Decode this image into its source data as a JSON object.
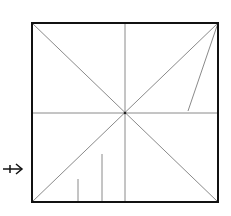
{
  "diagram": {
    "type": "origami-crease-pattern",
    "canvas": {
      "width": 231,
      "height": 216
    },
    "colors": {
      "background": "#ffffff",
      "border": "#111111",
      "crease": "#8a8a8a",
      "arrow": "#111111",
      "center_dot": "#222222"
    },
    "square": {
      "x1": 32,
      "y1": 23,
      "x2": 218,
      "y2": 202
    },
    "center": {
      "x": 125,
      "y": 113
    },
    "creases": [
      {
        "id": "diagonal-tl-br",
        "x1": 32,
        "y1": 23,
        "x2": 218,
        "y2": 202
      },
      {
        "id": "diagonal-tr-bl",
        "x1": 218,
        "y1": 23,
        "x2": 32,
        "y2": 202
      },
      {
        "id": "vertical-center",
        "x1": 125,
        "y1": 23,
        "x2": 125,
        "y2": 202
      },
      {
        "id": "horizontal-center",
        "x1": 32,
        "y1": 113,
        "x2": 218,
        "y2": 113
      },
      {
        "id": "corner-fold-guide",
        "x1": 218,
        "y1": 23,
        "x2": 188,
        "y2": 111
      },
      {
        "id": "short-vertical-mark",
        "x1": 78,
        "y1": 179,
        "x2": 78,
        "y2": 202
      },
      {
        "id": "tall-vertical-mark",
        "x1": 102,
        "y1": 154,
        "x2": 102,
        "y2": 202
      }
    ],
    "arrow": {
      "symbol": "fold-arrow",
      "x1": 3,
      "y1": 169,
      "x2": 22,
      "y2": 169,
      "tick_x": 10
    }
  }
}
